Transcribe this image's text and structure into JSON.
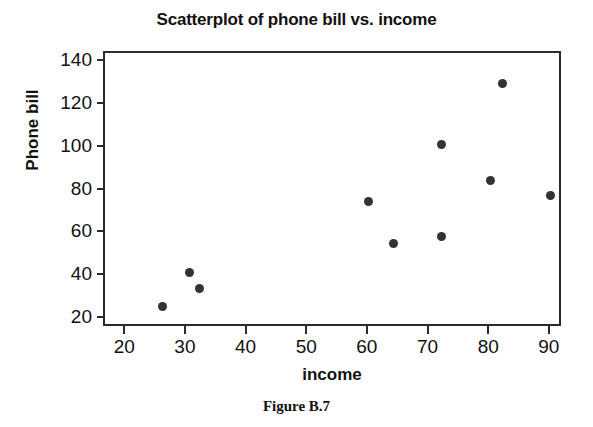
{
  "figure": {
    "caption": "Figure B.7"
  },
  "chart_data": {
    "type": "scatter",
    "title": "Scatterplot of phone bill vs. income",
    "xlabel": "income",
    "ylabel": "Phone bill",
    "xlim": [
      16.5,
      92
    ],
    "ylim": [
      16,
      144
    ],
    "xticks": [
      20,
      30,
      40,
      50,
      60,
      70,
      80,
      90
    ],
    "xtick_labels": [
      "20",
      "30",
      "40",
      "50",
      "60",
      "70",
      "80",
      "90"
    ],
    "yticks": [
      20,
      40,
      60,
      80,
      100,
      120,
      140
    ],
    "ytick_labels": [
      "20",
      "40",
      "60",
      "80",
      "100",
      "120",
      "140"
    ],
    "grid": false,
    "legend": null,
    "marker": "filled-circle",
    "marker_color": "#333333",
    "frame_color": "#2b2b2b",
    "x": [
      26,
      30.5,
      32,
      60,
      64,
      72,
      72,
      80,
      82,
      90
    ],
    "y": [
      26,
      42,
      34.5,
      75,
      55.5,
      101.5,
      58.5,
      84.5,
      130,
      77.5
    ],
    "points": [
      {
        "x": 26,
        "y": 26
      },
      {
        "x": 30.5,
        "y": 42
      },
      {
        "x": 32,
        "y": 34.5
      },
      {
        "x": 60,
        "y": 75
      },
      {
        "x": 64,
        "y": 55.5
      },
      {
        "x": 72,
        "y": 101.5
      },
      {
        "x": 72,
        "y": 58.5
      },
      {
        "x": 80,
        "y": 84.5
      },
      {
        "x": 82,
        "y": 130
      },
      {
        "x": 90,
        "y": 77.5
      }
    ]
  }
}
